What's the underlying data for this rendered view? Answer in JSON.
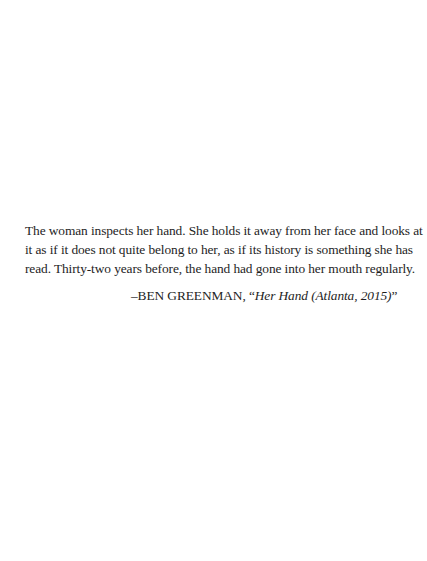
{
  "epigraph": {
    "lines": [
      "The woman inspects her hand. She holds it away from her face and looks at",
      "it as if it does not quite belong to her, as if its history is something she has",
      "read. Thirty-two years before, the hand had gone into her mouth regularly."
    ],
    "attribution": {
      "dash_and_author": "–BEN GREENMAN, ",
      "open_quote": "“",
      "title": "Her Hand (Atlanta, 2015)",
      "close_quote": "”"
    }
  }
}
